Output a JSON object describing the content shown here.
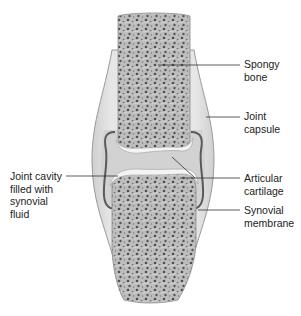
{
  "diagram": {
    "colors": {
      "background": "#ffffff",
      "capsule_fill": "#dcdcdc",
      "capsule_stroke": "#9a9a9a",
      "bone_fill": "#b8b8b8",
      "bone_pore": "#4a4a4a",
      "cartilage": "#f4f4f4",
      "cavity_fill": "#cfcfcf",
      "membrane": "#5a5a5a",
      "leader_line": "#333333",
      "label_text": "#222222"
    },
    "labels": [
      {
        "id": "spongy-bone",
        "text": "Spongy\nbone",
        "side": "right"
      },
      {
        "id": "joint-capsule",
        "text": "Joint\ncapsule",
        "side": "right"
      },
      {
        "id": "articular-cartilage",
        "text": "Articular\ncartilage",
        "side": "right"
      },
      {
        "id": "synovial-membrane",
        "text": "Synovial\nmembrane",
        "side": "right"
      },
      {
        "id": "joint-cavity",
        "text": "Joint cavity\nfilled with\nsynovial\nfluid",
        "side": "left"
      }
    ]
  }
}
